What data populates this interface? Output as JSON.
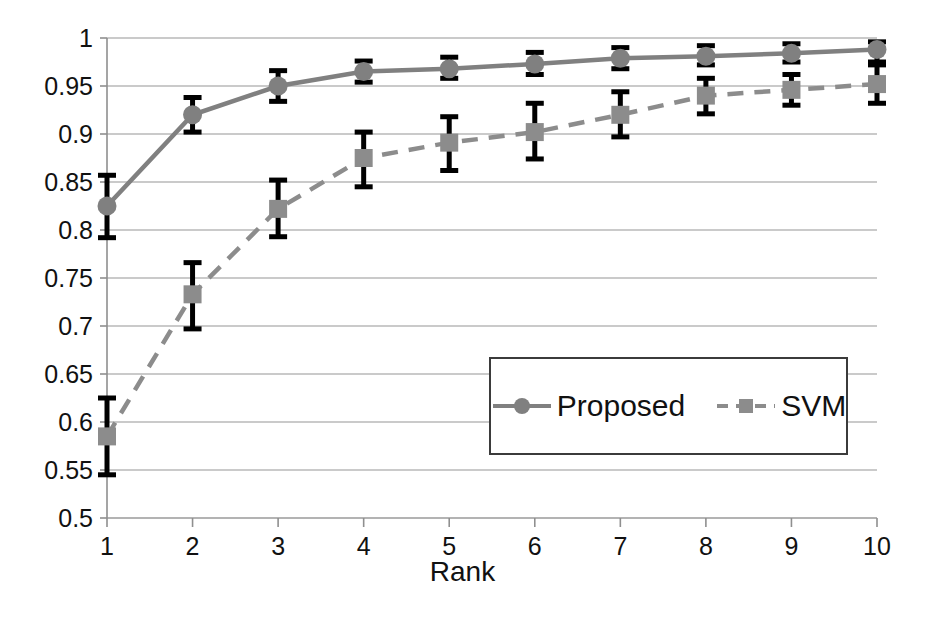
{
  "chart_data": {
    "type": "line",
    "title": "",
    "xlabel": "Rank",
    "ylabel": "",
    "x": [
      1,
      2,
      3,
      4,
      5,
      6,
      7,
      8,
      9,
      10
    ],
    "xtick_labels": [
      "1",
      "2",
      "3",
      "4",
      "5",
      "6",
      "7",
      "8",
      "9",
      "10"
    ],
    "ytick_labels": [
      "0.5",
      "0.55",
      "0.6",
      "0.65",
      "0.7",
      "0.75",
      "0.8",
      "0.85",
      "0.9",
      "0.95",
      "1"
    ],
    "ytick_values": [
      0.5,
      0.55,
      0.6,
      0.65,
      0.7,
      0.75,
      0.8,
      0.85,
      0.9,
      0.95,
      1.0
    ],
    "ylim": [
      0.5,
      1.0
    ],
    "xlim": [
      1,
      10
    ],
    "grid": "horizontal",
    "legend_position": "inside-lower-right",
    "error_bars": true,
    "series": [
      {
        "name": "Proposed",
        "style": "solid",
        "marker": "circle",
        "color": "#808080",
        "errorbar_color": "#000000",
        "values": [
          0.825,
          0.92,
          0.95,
          0.965,
          0.968,
          0.973,
          0.979,
          0.981,
          0.984,
          0.988
        ],
        "err_low": [
          0.792,
          0.902,
          0.934,
          0.954,
          0.958,
          0.962,
          0.968,
          0.972,
          0.975,
          0.975
        ],
        "err_high": [
          0.857,
          0.938,
          0.966,
          0.976,
          0.98,
          0.985,
          0.99,
          0.992,
          0.994,
          0.996
        ]
      },
      {
        "name": "SVM",
        "style": "dashed",
        "marker": "square",
        "color": "#8c8c8c",
        "errorbar_color": "#000000",
        "values": [
          0.585,
          0.733,
          0.822,
          0.875,
          0.891,
          0.902,
          0.92,
          0.94,
          0.946,
          0.952
        ],
        "err_low": [
          0.545,
          0.697,
          0.793,
          0.845,
          0.862,
          0.874,
          0.897,
          0.921,
          0.93,
          0.932
        ],
        "err_high": [
          0.625,
          0.766,
          0.852,
          0.902,
          0.918,
          0.932,
          0.944,
          0.958,
          0.962,
          0.972
        ]
      }
    ]
  },
  "axes": {
    "x_title": "Rank"
  },
  "legend": {
    "entries": [
      {
        "label": "Proposed"
      },
      {
        "label": "SVM"
      }
    ]
  }
}
